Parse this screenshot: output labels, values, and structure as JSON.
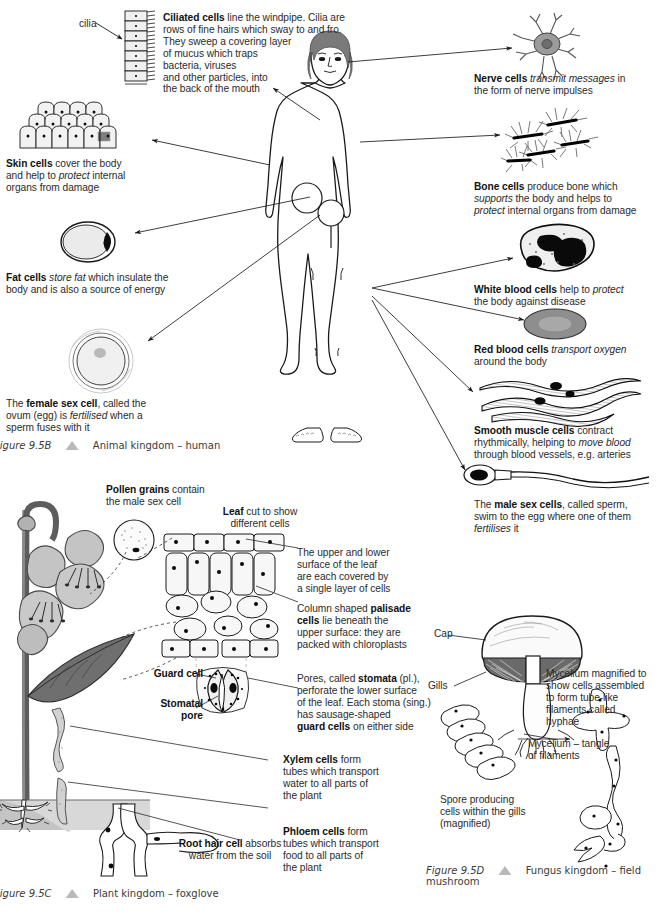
{
  "page": {
    "width": 659,
    "height": 912,
    "background": "#ffffff",
    "ink": "#222222",
    "accent_gray": "#b9b9b9"
  },
  "panels": [
    {
      "id": "animal",
      "figure_number": "Figure 9.5B",
      "caption": "Animal kingdom – human",
      "subject": "human-body-outline"
    },
    {
      "id": "plant",
      "figure_number": "Figure 9.5C",
      "caption": "Plant kingdom – foxglove",
      "subject": "foxglove-plant"
    },
    {
      "id": "fungus",
      "figure_number": "Figure 9.5D",
      "caption": "Fungus kingdom – field mushroom",
      "subject": "field-mushroom"
    }
  ],
  "animal_panel": {
    "cilia_label": "cilia",
    "annotations": [
      {
        "id": "ciliated-cells",
        "html": "<b>Ciliated cells</b> line the windpipe. Cilia are\nrows of fine hairs which sway to and fro.\nThey sweep a covering layer\nof mucus which traps\nbacteria, viruses\nand other particles, into\nthe back of the mouth",
        "plain": "Ciliated cells line the windpipe. Cilia are rows of fine hairs which sway to and fro. They sweep a covering layer of mucus which traps bacteria, viruses and other particles, into the back of the mouth"
      },
      {
        "id": "skin-cells",
        "html": "<b>Skin cells</b> cover the body\nand help to <i>protect</i> internal\norgans from damage",
        "plain": "Skin cells cover the body and help to protect internal organs from damage"
      },
      {
        "id": "fat-cells",
        "html": "<b>Fat cells</b> <i>store fat</i> which insulate the\nbody and is also a source of energy",
        "plain": "Fat cells store fat which insulate the body and is also a source of energy"
      },
      {
        "id": "female-sex-cell",
        "html": "The <b>female sex cell</b>, called the\novum (egg) is <i>fertilised</i> when a\nsperm fuses with it",
        "plain": "The female sex cell, called the ovum (egg) is fertilised when a sperm fuses with it"
      },
      {
        "id": "nerve-cells",
        "html": "<b>Nerve cells</b> <i>transmit messages</i> in\nthe form of nerve impulses",
        "plain": "Nerve cells transmit messages in the form of nerve impulses"
      },
      {
        "id": "bone-cells",
        "html": "<b>Bone cells</b> produce bone which\n<i>supports</i> the body and helps to\n<i>protect</i> internal organs from damage",
        "plain": "Bone cells produce bone which supports the body and helps to protect internal organs from damage"
      },
      {
        "id": "white-blood-cells",
        "html": "<b>White blood cells</b> help to <i>protect</i>\nthe body against disease",
        "plain": "White blood cells help to protect the body against disease"
      },
      {
        "id": "red-blood-cells",
        "html": "<b>Red blood cells</b> <i>transport oxygen</i>\naround the body",
        "plain": "Red blood cells transport oxygen around the body"
      },
      {
        "id": "smooth-muscle-cells",
        "html": "<b>Smooth muscle cells</b> contract\nrhythmically, helping to <i>move blood</i>\nthrough blood vessels, e.g. arteries",
        "plain": "Smooth muscle cells contract rhythmically, helping to move blood through blood vessels, e.g. arteries"
      },
      {
        "id": "male-sex-cells",
        "html": "The <b>male sex cells</b>, called sperm,\nswim to the egg where one of them\n<i>fertilises</i> it",
        "plain": "The male sex cells, called sperm, swim to the egg where one of them fertilises it"
      }
    ]
  },
  "plant_panel": {
    "annotations": [
      {
        "id": "pollen-grains",
        "html": "<b>Pollen grains</b> contain\nthe male sex cell",
        "plain": "Pollen grains contain the male sex cell"
      },
      {
        "id": "leaf-cut",
        "html": "<b>Leaf</b> cut to show\ndifferent cells",
        "plain": "Leaf cut to show different cells"
      },
      {
        "id": "epidermis",
        "html": "The upper and lower\nsurface of the leaf\nare each covered by\na single layer of cells",
        "plain": "The upper and lower surface of the leaf are each covered by a single layer of cells"
      },
      {
        "id": "palisade-cells",
        "html": "Column shaped <b>palisade</b>\n<b>cells</b> lie beneath the\nupper surface: they are\npacked with chloroplasts",
        "plain": "Column shaped palisade cells lie beneath the upper surface: they are packed with chloroplasts"
      },
      {
        "id": "stomata",
        "html": "Pores, called <b>stomata</b> (pl.),\nperforate the lower surface\nof the leaf. Each stoma (sing.)\nhas sausage-shaped\n<b>guard cells</b> on either side",
        "plain": "Pores, called stomata (pl.), perforate the lower surface of the leaf. Each stoma (sing.) has sausage-shaped guard cells on either side"
      },
      {
        "id": "guard-cell",
        "html": "<b>Guard cell</b>",
        "plain": "Guard cell"
      },
      {
        "id": "stomatal-pore",
        "html": "<b>Stomatal</b>\n<b>pore</b>",
        "plain": "Stomatal pore"
      },
      {
        "id": "xylem-cells",
        "html": "<b>Xylem cells</b> form\ntubes which transport\nwater to all parts of\nthe plant",
        "plain": "Xylem cells form tubes which transport water to all parts of the plant"
      },
      {
        "id": "phloem-cells",
        "html": "<b>Phloem cells</b> form\ntubes which transport\nfood to all parts of\nthe plant",
        "plain": "Phloem cells form tubes which transport food to all parts of the plant"
      },
      {
        "id": "root-hair-cell",
        "html": "<b>Root hair cell</b> absorbs\nwater from the soil",
        "plain": "Root hair cell absorbs water from the soil"
      }
    ]
  },
  "fungus_panel": {
    "annotations": [
      {
        "id": "cap",
        "html": "Cap",
        "plain": "Cap"
      },
      {
        "id": "gills",
        "html": "Gills",
        "plain": "Gills"
      },
      {
        "id": "mycelium-magnified",
        "html": "Mycelium magnified to\nshow cells assembled\nto form tube-like\nfilaments called\nhyphae",
        "plain": "Mycelium magnified to show cells assembled to form tube-like filaments called hyphae"
      },
      {
        "id": "mycelium-tangle",
        "html": "Mycelium – tangle\nof filaments",
        "plain": "Mycelium – tangle of filaments"
      },
      {
        "id": "spore-producing-cells",
        "html": "Spore producing\ncells within the gills\n(magnified)",
        "plain": "Spore producing cells within the gills (magnified)"
      }
    ]
  }
}
